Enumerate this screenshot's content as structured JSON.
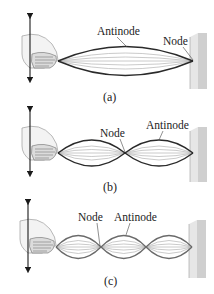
{
  "figure": {
    "colors": {
      "string_outline": "#2a2a2a",
      "string_ghost": "#b9b9b9",
      "wall_face": "#cfcfcf",
      "wall_side": "#e6e6e6",
      "arrow": "#1a1a1a",
      "hand": "#f2f2f2"
    },
    "panels": [
      {
        "id": "a",
        "caption": "(a)",
        "loops": 1,
        "labels": [
          {
            "text": "Antinode",
            "target": "antinode"
          },
          {
            "text": "Node",
            "target": "node-at-wall"
          }
        ]
      },
      {
        "id": "b",
        "caption": "(b)",
        "loops": 2,
        "labels": [
          {
            "text": "Node",
            "target": "middle-node"
          },
          {
            "text": "Antinode",
            "target": "second-antinode"
          }
        ]
      },
      {
        "id": "c",
        "caption": "(c)",
        "loops": 3,
        "labels": [
          {
            "text": "Node",
            "target": "first-node"
          },
          {
            "text": "Antinode",
            "target": "second-antinode"
          }
        ]
      }
    ]
  }
}
